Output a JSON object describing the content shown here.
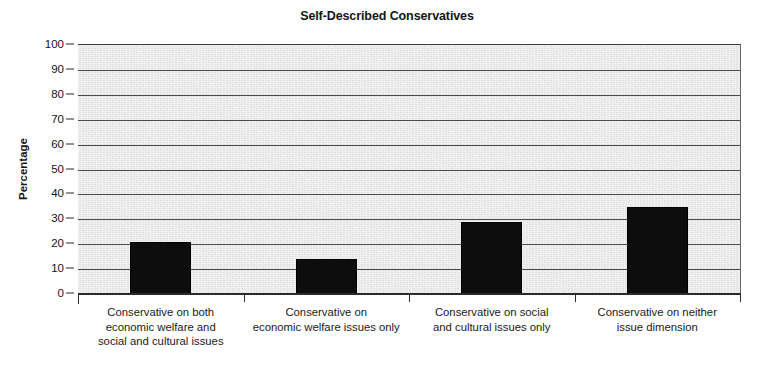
{
  "chart_data": {
    "type": "bar",
    "title": "Self-Described Conservatives",
    "xlabel": "",
    "ylabel": "Percentage",
    "ylim": [
      0,
      100
    ],
    "yticks": [
      0,
      10,
      20,
      30,
      40,
      50,
      60,
      70,
      80,
      90,
      100
    ],
    "ytick_labels": [
      "0",
      "10",
      "20",
      "30",
      "40",
      "50",
      "60",
      "70",
      "80",
      "90",
      "100"
    ],
    "grid": true,
    "legend": false,
    "bar_color": "#0d0d0d",
    "plot_background": "#e8e8e8",
    "categories": [
      "Conservative on both economic welfare and social and cultural issues",
      "Conservative on economic welfare issues only",
      "Conservative on social and cultural issues only",
      "Conservative on neither issue dimension"
    ],
    "category_lines": [
      [
        "Conservative on both",
        "economic welfare and",
        "social and cultural issues"
      ],
      [
        "Conservative on",
        "economic welfare issues only"
      ],
      [
        "Conservative on social",
        "and cultural issues only"
      ],
      [
        "Conservative on neither",
        "issue dimension"
      ]
    ],
    "values": [
      21,
      14,
      29,
      35
    ]
  }
}
